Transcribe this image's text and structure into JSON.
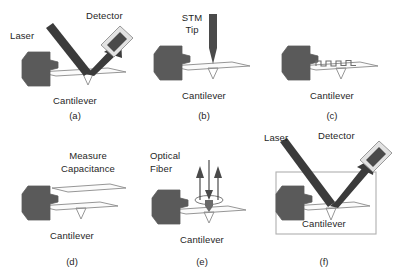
{
  "figure": {
    "background_color": "#ffffff",
    "chip_color": "#5a5a5a",
    "cantilever_fill": "#fbfbfb",
    "outline_color": "#8a8a8a",
    "beam_color": "#3b3b3b",
    "text_color": "#1f1f1f"
  },
  "panels": [
    {
      "id": "a",
      "tag": "(a)",
      "method": "optical-beam-deflection",
      "labels": {
        "laser": "Laser",
        "detector": "Detector",
        "cantilever": "Cantilever"
      }
    },
    {
      "id": "b",
      "tag": "(b)",
      "method": "stm-tip",
      "labels": {
        "tip_line1": "STM",
        "tip_line2": "Tip",
        "cantilever": "Cantilever"
      }
    },
    {
      "id": "c",
      "tag": "(c)",
      "method": "piezoresistive-coil",
      "labels": {
        "cantilever": "Cantilever"
      }
    },
    {
      "id": "d",
      "tag": "(d)",
      "method": "capacitance",
      "labels": {
        "measure_line1": "Measure",
        "measure_line2": "Capacitance",
        "cantilever": "Cantilever"
      }
    },
    {
      "id": "e",
      "tag": "(e)",
      "method": "optical-fiber-interferometry",
      "labels": {
        "fiber_line1": "Optical",
        "fiber_line2": "Fiber",
        "cantilever": "Cantilever"
      }
    },
    {
      "id": "f",
      "tag": "(f)",
      "method": "optical-beam-deflection-in-cell",
      "labels": {
        "laser": "Laser",
        "detector": "Detector",
        "cantilever": "Cantilever"
      }
    }
  ]
}
